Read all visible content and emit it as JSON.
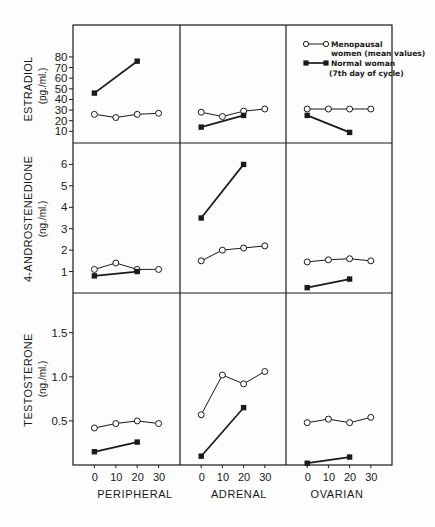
{
  "figure": {
    "rows": [
      {
        "label": "ESTRADIOL",
        "unit": "(pg./ml.)",
        "ticks": [
          {
            "label": "10",
            "value": 10
          },
          {
            "label": "20",
            "value": 20
          },
          {
            "label": "30",
            "value": 30
          },
          {
            "label": "40",
            "value": 40
          },
          {
            "label": "50",
            "value": 50
          },
          {
            "label": "60",
            "value": 60
          },
          {
            "label": "70",
            "value": 70
          },
          {
            "label": "80",
            "value": 80
          }
        ]
      },
      {
        "label": "4-ANDROSTENEDIONE",
        "unit": "(ng./ml.)",
        "ticks": [
          {
            "label": "1",
            "value": 1
          },
          {
            "label": "2",
            "value": 2
          },
          {
            "label": "3",
            "value": 3
          },
          {
            "label": "4",
            "value": 4
          },
          {
            "label": "5",
            "value": 5
          },
          {
            "label": "6",
            "value": 6
          }
        ]
      },
      {
        "label": "TESTOSTERONE",
        "unit": "(ng./ml.)",
        "ticks": [
          {
            "label": "0.5",
            "value": 0.5
          },
          {
            "label": "1.0",
            "value": 1.0
          },
          {
            "label": "1.5",
            "value": 1.5
          }
        ]
      }
    ],
    "columns": [
      {
        "label": "PERIPHERAL"
      },
      {
        "label": "ADRENAL"
      },
      {
        "label": "OVARIAN"
      }
    ],
    "x_ticks": [
      "0",
      "10",
      "20",
      "30"
    ],
    "legend": {
      "menopausal_line1": "Menopausal",
      "menopausal_line2": "women (mean values)",
      "normal_line1": "Normal woman",
      "normal_line2": "(7th day of cycle)"
    },
    "colors": {
      "ink": "#1a1a1a",
      "background": "#fdfdfd"
    }
  },
  "chart_data": [
    {
      "type": "line",
      "row": 0,
      "col": 0,
      "xlabel": "PERIPHERAL",
      "ylabel": "ESTRADIOL (pg./ml.)",
      "x_ticks": [
        0,
        10,
        20,
        30
      ],
      "y_ticks": [
        10,
        20,
        30,
        40,
        50,
        60,
        70,
        80
      ],
      "xlim": [
        -10,
        40
      ],
      "ylim": [
        0,
        110
      ],
      "grid": false,
      "series": [
        {
          "name": "Menopausal women (mean values)",
          "marker": "open-circle",
          "x": [
            0,
            10,
            20,
            30
          ],
          "values": [
            26,
            23,
            26,
            27
          ]
        },
        {
          "name": "Normal woman (7th day of cycle)",
          "marker": "filled-square",
          "x": [
            0,
            20
          ],
          "values": [
            46,
            76
          ]
        }
      ]
    },
    {
      "type": "line",
      "row": 0,
      "col": 1,
      "xlabel": "ADRENAL",
      "ylabel": "ESTRADIOL (pg./ml.)",
      "x_ticks": [
        0,
        10,
        20,
        30
      ],
      "y_ticks": [
        10,
        20,
        30,
        40,
        50,
        60,
        70,
        80
      ],
      "xlim": [
        -10,
        40
      ],
      "ylim": [
        0,
        110
      ],
      "grid": false,
      "series": [
        {
          "name": "Menopausal women (mean values)",
          "marker": "open-circle",
          "x": [
            0,
            10,
            20,
            30
          ],
          "values": [
            28,
            24,
            29,
            31
          ]
        },
        {
          "name": "Normal woman (7th day of cycle)",
          "marker": "filled-square",
          "x": [
            0,
            20
          ],
          "values": [
            14,
            25
          ]
        }
      ]
    },
    {
      "type": "line",
      "row": 0,
      "col": 2,
      "xlabel": "OVARIAN",
      "ylabel": "ESTRADIOL (pg./ml.)",
      "x_ticks": [
        0,
        10,
        20,
        30
      ],
      "y_ticks": [
        10,
        20,
        30,
        40,
        50,
        60,
        70,
        80
      ],
      "xlim": [
        -10,
        40
      ],
      "ylim": [
        0,
        110
      ],
      "grid": false,
      "legend_position": "top-right (this panel)",
      "series": [
        {
          "name": "Menopausal women (mean values)",
          "marker": "open-circle",
          "x": [
            0,
            10,
            20,
            30
          ],
          "values": [
            31,
            31,
            31,
            31
          ]
        },
        {
          "name": "Normal woman (7th day of cycle)",
          "marker": "filled-square",
          "x": [
            0,
            20
          ],
          "values": [
            25,
            9
          ]
        }
      ]
    },
    {
      "type": "line",
      "row": 1,
      "col": 0,
      "xlabel": "PERIPHERAL",
      "ylabel": "4-ANDROSTENEDIONE (ng./ml.)",
      "x_ticks": [
        0,
        10,
        20,
        30
      ],
      "y_ticks": [
        1,
        2,
        3,
        4,
        5,
        6
      ],
      "xlim": [
        -10,
        40
      ],
      "ylim": [
        0,
        7
      ],
      "grid": false,
      "series": [
        {
          "name": "Menopausal women (mean values)",
          "marker": "open-circle",
          "x": [
            0,
            10,
            20,
            30
          ],
          "values": [
            1.1,
            1.4,
            1.1,
            1.1
          ]
        },
        {
          "name": "Normal woman (7th day of cycle)",
          "marker": "filled-square",
          "x": [
            0,
            20
          ],
          "values": [
            0.8,
            1.0
          ]
        }
      ]
    },
    {
      "type": "line",
      "row": 1,
      "col": 1,
      "xlabel": "ADRENAL",
      "ylabel": "4-ANDROSTENEDIONE (ng./ml.)",
      "x_ticks": [
        0,
        10,
        20,
        30
      ],
      "y_ticks": [
        1,
        2,
        3,
        4,
        5,
        6
      ],
      "xlim": [
        -10,
        40
      ],
      "ylim": [
        0,
        7
      ],
      "grid": false,
      "series": [
        {
          "name": "Menopausal women (mean values)",
          "marker": "open-circle",
          "x": [
            0,
            10,
            20,
            30
          ],
          "values": [
            1.5,
            2.0,
            2.1,
            2.2
          ]
        },
        {
          "name": "Normal woman (7th day of cycle)",
          "marker": "filled-square",
          "x": [
            0,
            20
          ],
          "values": [
            3.5,
            6.0
          ]
        }
      ]
    },
    {
      "type": "line",
      "row": 1,
      "col": 2,
      "xlabel": "OVARIAN",
      "ylabel": "4-ANDROSTENEDIONE (ng./ml.)",
      "x_ticks": [
        0,
        10,
        20,
        30
      ],
      "y_ticks": [
        1,
        2,
        3,
        4,
        5,
        6
      ],
      "xlim": [
        -10,
        40
      ],
      "ylim": [
        0,
        7
      ],
      "grid": false,
      "series": [
        {
          "name": "Menopausal women (mean values)",
          "marker": "open-circle",
          "x": [
            0,
            10,
            20,
            30
          ],
          "values": [
            1.45,
            1.55,
            1.6,
            1.5
          ]
        },
        {
          "name": "Normal woman (7th day of cycle)",
          "marker": "filled-square",
          "x": [
            0,
            20
          ],
          "values": [
            0.25,
            0.65
          ]
        }
      ]
    },
    {
      "type": "line",
      "row": 2,
      "col": 0,
      "xlabel": "PERIPHERAL",
      "ylabel": "TESTOSTERONE (ng./ml.)",
      "x_ticks": [
        0,
        10,
        20,
        30
      ],
      "y_ticks": [
        0.5,
        1.0,
        1.5
      ],
      "xlim": [
        -10,
        40
      ],
      "ylim": [
        0,
        1.95
      ],
      "grid": false,
      "series": [
        {
          "name": "Menopausal women (mean values)",
          "marker": "open-circle",
          "x": [
            0,
            10,
            20,
            30
          ],
          "values": [
            0.42,
            0.47,
            0.5,
            0.47
          ]
        },
        {
          "name": "Normal woman (7th day of cycle)",
          "marker": "filled-square",
          "x": [
            0,
            20
          ],
          "values": [
            0.15,
            0.26
          ]
        }
      ]
    },
    {
      "type": "line",
      "row": 2,
      "col": 1,
      "xlabel": "ADRENAL",
      "ylabel": "TESTOSTERONE (ng./ml.)",
      "x_ticks": [
        0,
        10,
        20,
        30
      ],
      "y_ticks": [
        0.5,
        1.0,
        1.5
      ],
      "xlim": [
        -10,
        40
      ],
      "ylim": [
        0,
        1.95
      ],
      "grid": false,
      "series": [
        {
          "name": "Menopausal women (mean values)",
          "marker": "open-circle",
          "x": [
            0,
            10,
            20,
            30
          ],
          "values": [
            0.57,
            1.02,
            0.92,
            1.06
          ]
        },
        {
          "name": "Normal woman (7th day of cycle)",
          "marker": "filled-square",
          "x": [
            0,
            20
          ],
          "values": [
            0.1,
            0.65
          ]
        }
      ]
    },
    {
      "type": "line",
      "row": 2,
      "col": 2,
      "xlabel": "OVARIAN",
      "ylabel": "TESTOSTERONE (ng./ml.)",
      "x_ticks": [
        0,
        10,
        20,
        30
      ],
      "y_ticks": [
        0.5,
        1.0,
        1.5
      ],
      "xlim": [
        -10,
        40
      ],
      "ylim": [
        0,
        1.95
      ],
      "grid": false,
      "series": [
        {
          "name": "Menopausal women (mean values)",
          "marker": "open-circle",
          "x": [
            0,
            10,
            20,
            30
          ],
          "values": [
            0.48,
            0.52,
            0.48,
            0.54
          ]
        },
        {
          "name": "Normal woman (7th day of cycle)",
          "marker": "filled-square",
          "x": [
            0,
            20
          ],
          "values": [
            0.02,
            0.09
          ]
        }
      ]
    }
  ]
}
